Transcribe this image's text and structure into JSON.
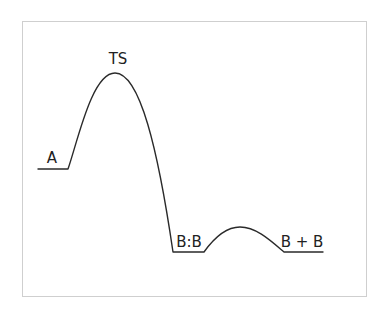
{
  "diagram": {
    "type": "reaction-energy-profile",
    "colors": {
      "line": "#2a2a2a",
      "frame": "#cfcfcf",
      "background": "#ffffff",
      "text": "#222222"
    },
    "labels": {
      "reactant": "A",
      "transition_state": "TS",
      "intermediate": "B:B",
      "product": "B + B"
    }
  }
}
